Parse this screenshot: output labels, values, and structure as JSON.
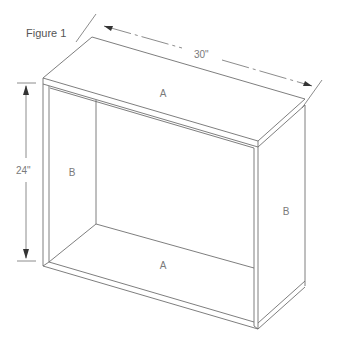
{
  "figure": {
    "title": "Figure 1"
  },
  "dimensions": {
    "width_label": "30\"",
    "height_label": "24\""
  },
  "panels": {
    "top": "A",
    "bottom": "A",
    "left_side": "B",
    "right_side": "B"
  },
  "colors": {
    "line": "#6f6f6f",
    "label": "#7a7a7a",
    "background": "#ffffff"
  }
}
